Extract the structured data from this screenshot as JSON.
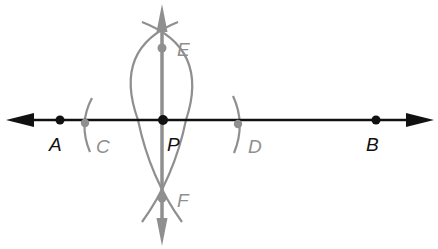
{
  "diagram": {
    "colors": {
      "main_line": "#111111",
      "construction": "#8f8f8f",
      "background": "#ffffff"
    },
    "points": [
      {
        "id": "A",
        "label": "A",
        "x": 60,
        "y": 120,
        "style": "main"
      },
      {
        "id": "P",
        "label": "P",
        "x": 163,
        "y": 120,
        "style": "main"
      },
      {
        "id": "B",
        "label": "B",
        "x": 376,
        "y": 120,
        "style": "main"
      },
      {
        "id": "C",
        "label": "C",
        "x": 85,
        "y": 123,
        "style": "construction"
      },
      {
        "id": "D",
        "label": "D",
        "x": 238,
        "y": 124,
        "style": "construction"
      },
      {
        "id": "E",
        "label": "E",
        "x": 162,
        "y": 48,
        "style": "construction"
      },
      {
        "id": "F",
        "label": "F",
        "x": 162,
        "y": 198,
        "style": "construction"
      }
    ],
    "lines": [
      {
        "id": "AB",
        "type": "line",
        "description": "Line AB with arrows both ends"
      },
      {
        "id": "EF",
        "type": "line",
        "description": "Perpendicular line through E, P, F with arrows both ends"
      }
    ],
    "arcs": [
      {
        "id": "arc-C",
        "description": "Arc marking C on line"
      },
      {
        "id": "arc-D",
        "description": "Arc marking D on line"
      },
      {
        "id": "arc-E-F-left",
        "description": "Arc from D intersecting at E and F"
      },
      {
        "id": "arc-E-F-right",
        "description": "Arc from C intersecting at E and F"
      }
    ]
  }
}
